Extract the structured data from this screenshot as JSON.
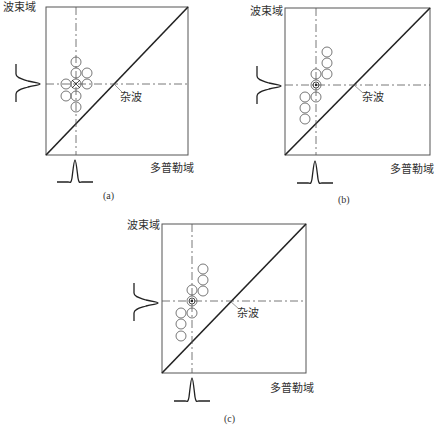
{
  "panels": [
    {
      "id": "a",
      "caption": "(a)",
      "y_axis_label": "波束域",
      "x_axis_label": "多普勒域",
      "clutter_label": "杂波",
      "box": [
        46,
        7,
        188,
        155
      ],
      "crosshair": [
        76,
        84
      ],
      "circles": [
        [
          76,
          62
        ],
        [
          76,
          73
        ],
        [
          87,
          73
        ],
        [
          66,
          84
        ],
        [
          76,
          84
        ],
        [
          87,
          84
        ],
        [
          66,
          96
        ],
        [
          76,
          96
        ],
        [
          76,
          107
        ]
      ],
      "target_marker": [
        76,
        84
      ]
    },
    {
      "id": "b",
      "caption": "(b)",
      "y_axis_label": "波束域",
      "x_axis_label": "多普勒域",
      "clutter_label": "杂波",
      "box": [
        285,
        8,
        430,
        155
      ],
      "crosshair": [
        316,
        85
      ],
      "circles": [
        [
          327,
          52
        ],
        [
          327,
          63
        ],
        [
          327,
          74
        ],
        [
          316,
          74
        ],
        [
          316,
          97
        ],
        [
          305,
          97
        ],
        [
          305,
          108
        ],
        [
          305,
          119
        ]
      ],
      "target_marker": [
        316,
        85
      ]
    },
    {
      "id": "c",
      "caption": "(c)",
      "y_axis_label": "波束域",
      "x_axis_label": "多普勒域",
      "clutter_label": "杂波",
      "box": [
        162,
        224,
        306,
        373
      ],
      "crosshair": [
        192,
        301
      ],
      "circles": [
        [
          203,
          269
        ],
        [
          203,
          280
        ],
        [
          203,
          291
        ],
        [
          192,
          290
        ],
        [
          192,
          313
        ],
        [
          181,
          313
        ],
        [
          181,
          324
        ],
        [
          181,
          336
        ]
      ],
      "target_marker": [
        192,
        301
      ]
    }
  ]
}
